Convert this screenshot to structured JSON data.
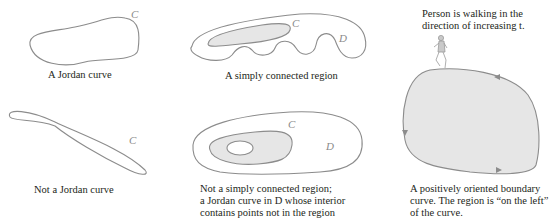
{
  "panels": [
    {
      "id": "jordan",
      "caption": [
        "A Jordan curve"
      ],
      "curve_label": "C"
    },
    {
      "id": "simply",
      "caption": [
        "A simply connected region"
      ],
      "curve_label": "C",
      "region_label": "D"
    },
    {
      "id": "not-jordan",
      "caption": [
        "Not a Jordan curve"
      ],
      "curve_label": "C"
    },
    {
      "id": "not-simply",
      "caption": [
        "Not a simply connected region;",
        "a Jordan curve in D whose interior",
        "contains points not in the region"
      ],
      "curve_label": "C",
      "region_label": "D"
    },
    {
      "id": "oriented",
      "top_caption": [
        "Person is walking in the",
        "direction of increasing t."
      ],
      "caption": [
        "A positively oriented boundary",
        "curve. The region is “on the left”",
        "of the curve."
      ]
    }
  ],
  "colors": {
    "stroke": "#8c8c8c",
    "shade": "#e6e6e6",
    "text": "#231f20",
    "label": "#8a8a8a"
  }
}
